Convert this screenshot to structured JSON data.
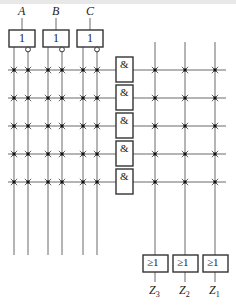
{
  "diagram": {
    "inputs": [
      {
        "name": "A",
        "gate_label": "1"
      },
      {
        "name": "B",
        "gate_label": "1"
      },
      {
        "name": "C",
        "gate_label": "1"
      }
    ],
    "and_array": {
      "gate_label": "&",
      "count": 5
    },
    "or_array": {
      "gate_label": "≥1",
      "outputs": [
        "Z3",
        "Z2",
        "Z1"
      ],
      "output_labels": [
        {
          "main": "Z",
          "sub": "3"
        },
        {
          "main": "Z",
          "sub": "2"
        },
        {
          "main": "Z",
          "sub": "1"
        }
      ]
    },
    "connection_symbol": "× dot (programmable junction)",
    "colors": {
      "wire": "#6a6a6a",
      "box": "#333333",
      "background": "#ffffff"
    }
  }
}
